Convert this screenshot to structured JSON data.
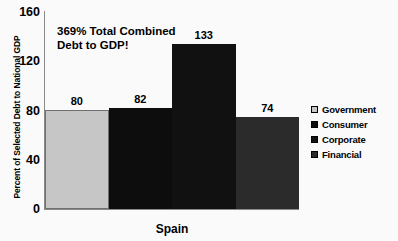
{
  "chart_data": {
    "type": "bar",
    "title": "",
    "annotation": [
      "369% Total Combined",
      "Debt to GDP!"
    ],
    "categories": [
      "Spain"
    ],
    "xlabel": "Spain",
    "ylabel": "Percent of Selected Debt to National GDP",
    "ylim": [
      0,
      160
    ],
    "yticks": [
      160,
      120,
      80,
      40,
      0
    ],
    "grid": false,
    "legend_position": "right",
    "series": [
      {
        "name": "Government",
        "values": [
          80
        ],
        "color": "#c6c6c6"
      },
      {
        "name": "Consumer",
        "values": [
          82
        ],
        "color": "#0d0d0d"
      },
      {
        "name": "Corporate",
        "values": [
          133
        ],
        "color": "#111111"
      },
      {
        "name": "Financial",
        "values": [
          74
        ],
        "color": "#2b2b2b"
      }
    ],
    "data_labels": [
      "80",
      "82",
      "133",
      "74"
    ]
  },
  "legend": {
    "items": [
      {
        "label": "Government"
      },
      {
        "label": "Consumer"
      },
      {
        "label": "Corporate"
      },
      {
        "label": "Financial"
      }
    ]
  }
}
